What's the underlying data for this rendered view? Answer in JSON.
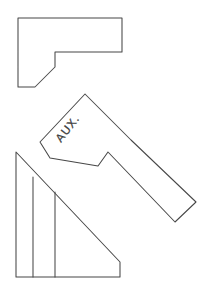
{
  "sheet": {
    "title": "Auxiliary View Orthographic Sketch",
    "width": 209,
    "height": 291,
    "background_color": "#ffffff",
    "line_color": "#474747",
    "text_color": "#3d3d3d",
    "line_width": 1.05,
    "medium": "hand-drawn pencil sketch"
  },
  "labels": {
    "aux_view": "AUX.",
    "aux_view_rotation_deg": -52
  },
  "views": [
    {
      "name": "top-view",
      "description": "L-shaped top view outline with stepped notch at lower left",
      "closed": true,
      "points": "18,18 122,18 122,52 55,52 55,67 35,87 18,87"
    },
    {
      "name": "auxiliary-view",
      "description": "Rotated auxiliary view: arrow-head body with angled arm extending to lower right, containing a V notch on the lower edge",
      "closed": true,
      "points": "85,94 131,140 196,202 175,222 108,152 98,166 50,158 40,142"
    },
    {
      "name": "front-view",
      "description": "Right triangle front view with vertical left edge, sloping hypotenuse and short vertical step at right",
      "closed": true,
      "points": "16,152 120,262 120,277 16,277"
    }
  ],
  "internal_lines": [
    {
      "name": "front-view-rib-1",
      "description": "Vertical rib line from hypotenuse to bottom edge",
      "points": "33,177 33,277"
    },
    {
      "name": "front-view-rib-2",
      "description": "Second vertical rib line from hypotenuse to bottom edge",
      "points": "55,192 55,277"
    }
  ]
}
